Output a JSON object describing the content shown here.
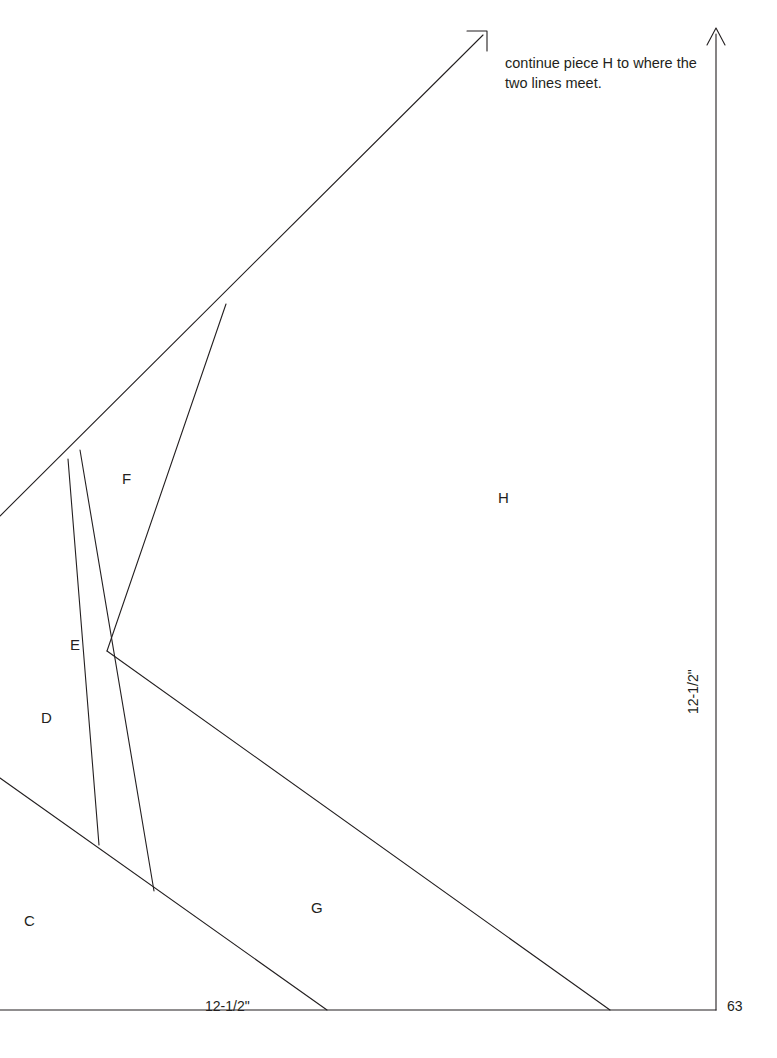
{
  "page": {
    "number": "63",
    "width": 777,
    "height": 1058,
    "background_color": "#ffffff",
    "ink_color": "#231f20"
  },
  "note": {
    "text": "continue piece H to where the two lines meet.",
    "x": 505,
    "y": 54
  },
  "dimensions": [
    {
      "id": "bottom",
      "label": "12-1/2\"",
      "x": 205,
      "y": 999,
      "orientation": "horizontal"
    },
    {
      "id": "right",
      "label": "12-1/2\"",
      "x": 700,
      "y": 700,
      "orientation": "vertical"
    }
  ],
  "pieces": [
    {
      "id": "C",
      "label": "C",
      "x": 24,
      "y": 913
    },
    {
      "id": "D",
      "label": "D",
      "x": 41,
      "y": 710
    },
    {
      "id": "E",
      "label": "E",
      "x": 70,
      "y": 637
    },
    {
      "id": "F",
      "label": "F",
      "x": 122,
      "y": 471
    },
    {
      "id": "G",
      "label": "G",
      "x": 311,
      "y": 900
    },
    {
      "id": "H",
      "label": "H",
      "x": 498,
      "y": 490
    }
  ],
  "geometry": {
    "stroke_color": "#231f20",
    "stroke_width": 1.1,
    "baseline": {
      "x1": 0,
      "y1": 1010,
      "x2": 716,
      "y2": 1010
    },
    "right_axis": {
      "x1": 716,
      "y1": 1010,
      "x2": 716,
      "y2": 34
    },
    "right_arrow": "M 716 28 L 707 45 M 716 28 L 725 45",
    "upper_diagonal": {
      "x1": 0,
      "y1": 516,
      "x2": 483,
      "y2": 35
    },
    "upper_arrow": "M 487 31 L 487 51 M 487 31 L 467 31",
    "segments": [
      {
        "id": "d-left-edge",
        "x1": 68,
        "y1": 459,
        "x2": 99,
        "y2": 845
      },
      {
        "id": "e-left-edge",
        "x1": 80,
        "y1": 450,
        "x2": 154,
        "y2": 891
      },
      {
        "id": "f-right-edge",
        "x1": 226,
        "y1": 304,
        "x2": 107,
        "y2": 651
      },
      {
        "id": "cd-boundary",
        "x1": 0,
        "y1": 778,
        "x2": 327,
        "y2": 1010
      },
      {
        "id": "g-upper-edge",
        "x1": 107,
        "y1": 651,
        "x2": 610,
        "y2": 1010
      }
    ]
  }
}
